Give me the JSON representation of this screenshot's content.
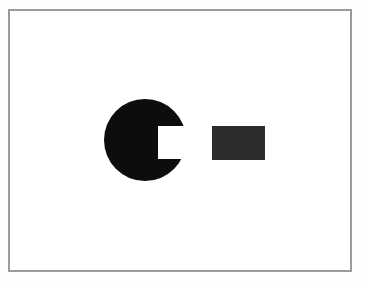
{
  "figure": {
    "background_color": "#fefefe",
    "canvas": {
      "width": 367,
      "height": 286
    },
    "frame": {
      "name": "image-border-frame",
      "stroke_color": "#9b9b9b",
      "stroke_width": 2,
      "x": 8,
      "y": 9,
      "width": 344,
      "height": 263,
      "fill_color": "#ffffff"
    },
    "shapes": [
      {
        "id": "notched-disc",
        "label": "Black disc with rectangular notch",
        "kind": "circle-with-rectangular-notch",
        "fill_color": "#0d0d0d",
        "center_x": 145,
        "center_y": 140,
        "radius": 41,
        "notch": {
          "label": "Rectangular bite removed from right side of disc",
          "x": 158,
          "y": 126,
          "width": 30,
          "height": 33,
          "fill_color": "#ffffff"
        }
      },
      {
        "id": "solid-rectangle",
        "label": "Dark solid rectangle",
        "kind": "rectangle",
        "fill_color": "#2d2d2d",
        "x": 212,
        "y": 126,
        "width": 53,
        "height": 34
      }
    ],
    "colors": {
      "disc": "#0d0d0d",
      "rectangle": "#2d2d2d",
      "frame": "#9b9b9b",
      "page_background": "#fefefe",
      "inner_background": "#ffffff"
    }
  }
}
